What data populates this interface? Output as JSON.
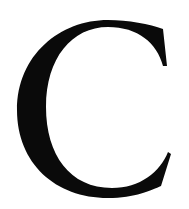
{
  "glyph": {
    "character": "C",
    "color": "#0a0a0a",
    "background": "#ffffff"
  }
}
